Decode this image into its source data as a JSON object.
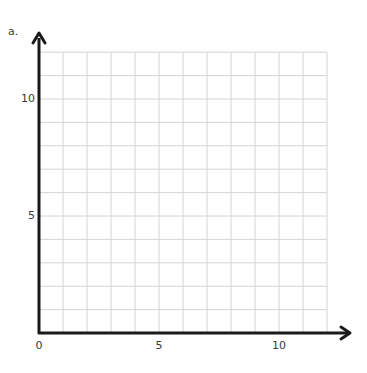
{
  "panel_label": "a.",
  "chart_data": {
    "type": "scatter",
    "title": "",
    "xlabel": "",
    "ylabel": "",
    "xlim": [
      0,
      12
    ],
    "ylim": [
      0,
      12
    ],
    "x_ticks": [
      0,
      5,
      10
    ],
    "y_ticks": [
      5,
      10
    ],
    "x_tick_labels": [
      "0",
      "5",
      "10"
    ],
    "y_tick_labels": [
      "5",
      "10"
    ],
    "grid": true,
    "grid_step": 1,
    "series": [],
    "axis_arrows": true
  },
  "colors": {
    "axis": "#1a1a1a",
    "grid": "#d4d4d4",
    "text": "#3a3a3a"
  }
}
